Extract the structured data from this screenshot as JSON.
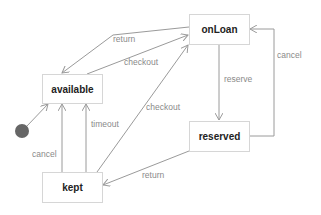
{
  "diagram": {
    "type": "state-machine",
    "states": [
      {
        "id": "available",
        "label": "available"
      },
      {
        "id": "onLoan",
        "label": "onLoan"
      },
      {
        "id": "reserved",
        "label": "reserved"
      },
      {
        "id": "kept",
        "label": "kept"
      }
    ],
    "initial_state": "available",
    "transitions": [
      {
        "from": "onLoan",
        "to": "available",
        "label": "return"
      },
      {
        "from": "available",
        "to": "onLoan",
        "label": "checkout"
      },
      {
        "from": "kept",
        "to": "onLoan",
        "label": "checkout"
      },
      {
        "from": "onLoan",
        "to": "reserved",
        "label": "reserve"
      },
      {
        "from": "reserved",
        "to": "onLoan",
        "label": "cancel"
      },
      {
        "from": "reserved",
        "to": "kept",
        "label": "return"
      },
      {
        "from": "kept",
        "to": "available",
        "label": "cancel"
      },
      {
        "from": "kept",
        "to": "available",
        "label": "timeout"
      }
    ],
    "colors": {
      "line": "#9a9a9a",
      "box_border": "#d6d6d6",
      "initial_dot": "#666666"
    }
  }
}
